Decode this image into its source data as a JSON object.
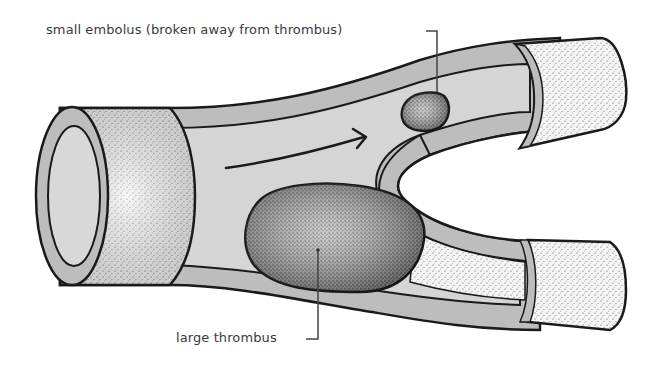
{
  "diagram": {
    "labels": {
      "embolus": "small embolus (broken away from thrombus)",
      "thrombus": "large thrombus"
    },
    "components": [
      {
        "id": "main-vessel",
        "description": "cut-away main artery with stippled outer wall"
      },
      {
        "id": "upper-branch",
        "description": "upper branch vessel ending in stippled cylinder"
      },
      {
        "id": "lower-branch",
        "description": "lower branch vessel, partially occluded"
      },
      {
        "id": "flow-arrow",
        "description": "arrow indicating direction of blood flow"
      },
      {
        "id": "large-thrombus",
        "description": "large stippled clot on lower vessel wall"
      },
      {
        "id": "small-embolus",
        "description": "small dark stippled clot in upper branch"
      }
    ],
    "colors": {
      "outline": "#1a1a1a",
      "wall_cut": "#b8b8b8",
      "lumen": "#d4d4d4",
      "stipple_light": "#f2f2f2",
      "stipple_dark": "#6a6a6a",
      "label_text": "#3a3a3a"
    }
  }
}
